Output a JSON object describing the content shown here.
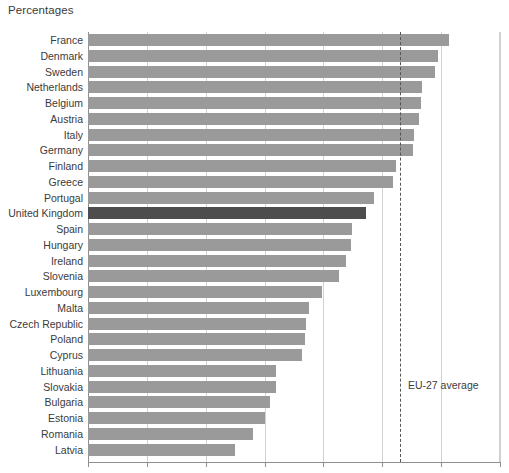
{
  "chart_data": {
    "type": "bar",
    "orientation": "horizontal",
    "title": "Percentages",
    "xlabel": "",
    "ylabel": "",
    "xlim": [
      0,
      70
    ],
    "xticks": [
      0,
      10,
      20,
      30,
      40,
      50,
      60,
      70
    ],
    "xtick_labels": [
      "",
      "",
      "",
      "",
      "",
      "",
      "",
      ""
    ],
    "grid": true,
    "legend": false,
    "categories": [
      "France",
      "Denmark",
      "Sweden",
      "Netherlands",
      "Belgium",
      "Austria",
      "Italy",
      "Germany",
      "Finland",
      "Greece",
      "Portugal",
      "United Kingdom",
      "Spain",
      "Hungary",
      "Ireland",
      "Slovenia",
      "Luxembourg",
      "Malta",
      "Czech Republic",
      "Poland",
      "Cyprus",
      "Lithuania",
      "Slovakia",
      "Bulgaria",
      "Estonia",
      "Romania",
      "Latvia"
    ],
    "values": [
      61.4,
      59.5,
      59.0,
      56.8,
      56.6,
      56.3,
      55.4,
      55.2,
      52.4,
      51.9,
      48.6,
      47.3,
      44.9,
      44.7,
      43.9,
      42.7,
      39.7,
      37.5,
      37.1,
      36.9,
      36.4,
      32.0,
      31.9,
      31.0,
      30.0,
      28.1,
      24.9
    ],
    "highlight_category": "United Kingdom",
    "annotations": [
      {
        "name": "eu-27-average",
        "label": "EU-27 average",
        "value": 53.0,
        "style": "dashed-vertical-line"
      }
    ],
    "colors": {
      "bar": "#9a9a9a",
      "bar_highlight": "#4d4d4d",
      "gridline": "#d2d2d2",
      "axis": "#8e8e8e",
      "text": "#3b3b3b",
      "average_line": "#555555",
      "background": "#ffffff"
    }
  }
}
